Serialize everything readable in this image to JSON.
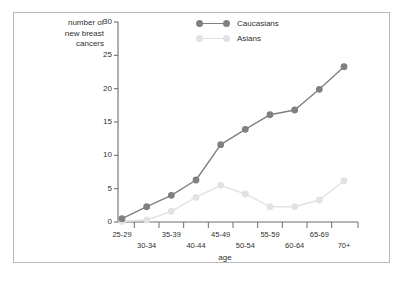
{
  "figure": {
    "border_color": "#b8b8b8",
    "background": "#ffffff"
  },
  "axis": {
    "ylabel": "number of\nnew breast\ncancers",
    "xlabel": "age",
    "yticks": [
      "30",
      "25",
      "20",
      "15",
      "10",
      "5",
      "0"
    ],
    "ytick_values": [
      30,
      25,
      20,
      15,
      10,
      5,
      0
    ],
    "xticks": [
      "25-29",
      "30-34",
      "35-39",
      "40-44",
      "45-49",
      "50-54",
      "55-59",
      "60-64",
      "65-69",
      "70+"
    ]
  },
  "legend": {
    "position": "top-center",
    "entries": [
      {
        "label": "Caucasians",
        "color": "#808080",
        "marker": "circle"
      },
      {
        "label": "Asians",
        "color": "#e2e2e2",
        "marker": "circle"
      }
    ]
  },
  "chart_data": {
    "type": "line",
    "title": "",
    "subtitle": "",
    "xlabel": "age",
    "ylabel": "number of new breast cancers",
    "categories": [
      "25-29",
      "30-34",
      "35-39",
      "40-44",
      "45-49",
      "50-54",
      "55-59",
      "60-64",
      "65-69",
      "70+"
    ],
    "series": [
      {
        "name": "Caucasians",
        "color": "#808080",
        "values": [
          0.5,
          2.3,
          4.0,
          6.3,
          11.6,
          13.9,
          16.1,
          16.8,
          19.9,
          23.3
        ]
      },
      {
        "name": "Asians",
        "color": "#e2e2e2",
        "values": [
          0.1,
          0.3,
          1.6,
          3.7,
          5.5,
          4.2,
          2.3,
          2.3,
          3.3,
          6.2
        ]
      }
    ],
    "ylim": [
      0,
      30
    ],
    "ytick_step": 5,
    "grid": false,
    "legend_position": "top-center"
  }
}
